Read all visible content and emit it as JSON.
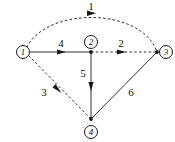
{
  "figure": {
    "kind": "directed-graph-diagram",
    "background_color": "#ffffff",
    "stroke_color": "#1a1a1a",
    "width": 175,
    "height": 142
  },
  "nodes": [
    {
      "id": "n1",
      "label": "①",
      "number": "1",
      "x": 25,
      "y": 52,
      "label_x": 16,
      "label_y": 45
    },
    {
      "id": "n2",
      "label": "②",
      "number": "2",
      "x": 91,
      "y": 52,
      "label_x": 84,
      "label_y": 35
    },
    {
      "id": "n3",
      "label": "③",
      "number": "3",
      "x": 157,
      "y": 52,
      "label_x": 159,
      "label_y": 45
    },
    {
      "id": "n4",
      "label": "④",
      "number": "4",
      "x": 91,
      "y": 119,
      "label_x": 84,
      "label_y": 125
    }
  ],
  "edges": [
    {
      "id": "e1",
      "label": "1",
      "from": "n1",
      "to": "n3",
      "style": "dashed",
      "shape": "arc",
      "label_x": 91,
      "label_y": 0,
      "arrow_x": 92,
      "arrow_y": 13
    },
    {
      "id": "e4",
      "label": "4",
      "from": "n1",
      "to": "n2",
      "style": "solid",
      "shape": "line",
      "label_x": 61,
      "label_y": 37,
      "arrow_x": 62,
      "arrow_y": 52
    },
    {
      "id": "e2",
      "label": "2",
      "from": "n2",
      "to": "n3",
      "style": "dashed",
      "shape": "line",
      "label_x": 121,
      "label_y": 37,
      "arrow_x": 122,
      "arrow_y": 52
    },
    {
      "id": "e5",
      "label": "5",
      "from": "n2",
      "to": "n4",
      "style": "solid",
      "shape": "line",
      "label_x": 83,
      "label_y": 67,
      "arrow_x": 91,
      "arrow_y": 87
    },
    {
      "id": "e3",
      "label": "3",
      "from": "n1",
      "to": "n4",
      "style": "dashed",
      "shape": "line",
      "label_x": 44,
      "label_y": 86,
      "arrow_x": 58,
      "arrow_y": 89
    },
    {
      "id": "e6",
      "label": "6",
      "from": "n4",
      "to": "n3",
      "style": "solid",
      "shape": "line",
      "label_x": 131,
      "label_y": 86,
      "arrow_x": 124,
      "arrow_y": 85
    }
  ]
}
